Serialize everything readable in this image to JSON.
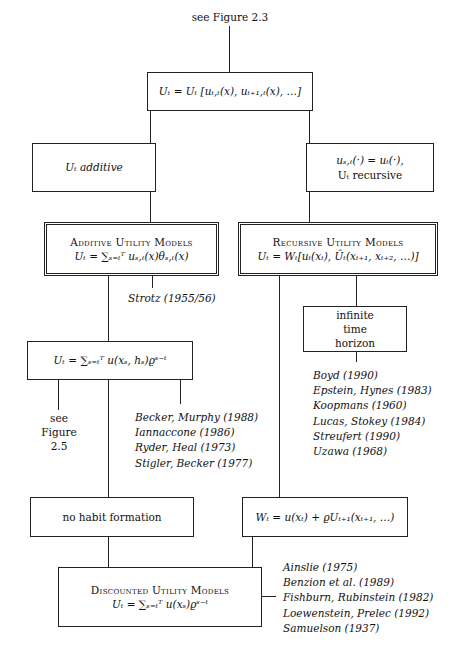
{
  "diagram": {
    "top_note": "see Figure 2.3",
    "root_box": {
      "formula": "Uₜ = Uₜ [uₜ,ₜ(x), uₜ₊₁,ₜ(x), …]"
    },
    "left_condition": {
      "text": "Uₜ additive"
    },
    "right_condition": {
      "line1": "uₛ,ₜ(·) = uₜ(·),",
      "line2": "Uₜ recursive"
    },
    "additive_models": {
      "title": "Additive Utility Models",
      "formula": "Uₜ = ∑ₛ₌ₜᵀ uₛ,ₜ(x)θₛ,ₜ(x)",
      "reference": "Strotz (1955/56)"
    },
    "recursive_models": {
      "title": "Recursive Utility Models",
      "formula": "Uₜ = Wₜ[uₜ(xₜ), Ûₜ(xₜ₊₁, xₜ₊₂, …)]"
    },
    "infinite_horizon": {
      "lines": [
        "infinite",
        "time",
        "horizon"
      ]
    },
    "recursive_refs": [
      "Boyd (1990)",
      "Epstein, Hynes (1983)",
      "Koopmans (1960)",
      "Lucas, Stokey (1984)",
      "Streufert (1990)",
      "Uzawa (1968)"
    ],
    "habit_box": {
      "formula": "Uₜ = ∑ₛ₌ₜᵀ u(xₛ, hₛ)ϱˢ⁻ᵗ"
    },
    "see_figure_25": {
      "lines": [
        "see",
        "Figure",
        "2.5"
      ]
    },
    "habit_refs": [
      "Becker, Murphy (1988)",
      "Iannaccone (1986)",
      "Ryder, Heal (1973)",
      "Stigler, Becker (1977)"
    ],
    "no_habit": {
      "text": "no habit formation"
    },
    "w_box": {
      "formula": "Wₜ = u(xₜ) + ϱUₜ₊₁(xₜ₊₁, …)"
    },
    "discounted_models": {
      "title": "Discounted Utility Models",
      "formula": "Uₜ = ∑ₛ₌ₜᵀ u(xₛ)ϱˢ⁻ᵗ"
    },
    "discounted_refs": [
      "Ainslie (1975)",
      "Benzion et al. (1989)",
      "Fishburn, Rubinstein (1982)",
      "Loewenstein, Prelec (1992)",
      "Samuelson (1937)"
    ]
  }
}
